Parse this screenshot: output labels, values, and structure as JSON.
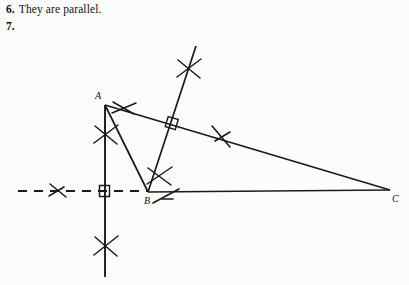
{
  "page": {
    "background_color": "#fcfcfc",
    "ink_color": "#1a1a1a",
    "width": 409,
    "height": 285
  },
  "answer_6": {
    "number": "6.",
    "text": "They are parallel."
  },
  "problem_7": {
    "number": "7."
  },
  "figure": {
    "caption": "geometric construction: triangle ABC with perpendicular bisector and altitude construction arcs",
    "points": {
      "A": {
        "label": "A",
        "x": 105,
        "y": 105,
        "label_x": 95,
        "label_y": 99
      },
      "B": {
        "label": "B",
        "x": 148,
        "y": 192,
        "label_x": 144,
        "label_y": 204
      },
      "C": {
        "label": "C",
        "x": 390,
        "y": 190,
        "label_x": 392,
        "label_y": 202
      }
    },
    "segments": {
      "AC": {
        "name": "segment-ac",
        "x1": 105,
        "y1": 105,
        "x2": 390,
        "y2": 190
      },
      "AB": {
        "name": "segment-ab",
        "x1": 105,
        "y1": 105,
        "x2": 148,
        "y2": 192
      },
      "BC": {
        "name": "segment-bc",
        "x1": 148,
        "y1": 192,
        "x2": 390,
        "y2": 190
      },
      "vertical": {
        "name": "vertical-construction-line",
        "x1": 105,
        "y1": 105,
        "x2": 105,
        "y2": 277
      },
      "altitude_ray": {
        "name": "altitude-ray-through-b",
        "x1": 148,
        "y1": 192,
        "x2": 196,
        "y2": 46
      }
    },
    "dashed_line": {
      "name": "dashed-horizontal-line",
      "x1": 18,
      "y1": 191,
      "x2": 148,
      "y2": 191,
      "dash": "9 7"
    },
    "right_angle_marks": [
      {
        "name": "right-angle-at-vertical-dashed",
        "x": 104,
        "y": 191
      },
      {
        "name": "right-angle-on-ac",
        "x": 170,
        "y": 128
      }
    ],
    "arc_marks": [
      {
        "name": "arc-mark-dashed-left",
        "x": 57,
        "y": 190
      },
      {
        "name": "arc-mark-at-a",
        "x": 124,
        "y": 107
      },
      {
        "name": "arc-mark-vertical-upper",
        "x": 105,
        "y": 134
      },
      {
        "name": "arc-mark-vertical-lower",
        "x": 105,
        "y": 246
      },
      {
        "name": "arc-mark-above-b",
        "x": 158,
        "y": 176
      },
      {
        "name": "arc-mark-at-b-right",
        "x": 166,
        "y": 196
      },
      {
        "name": "arc-mark-on-ray-top",
        "x": 188,
        "y": 68
      },
      {
        "name": "arc-mark-on-ac-right",
        "x": 221,
        "y": 135
      }
    ]
  }
}
